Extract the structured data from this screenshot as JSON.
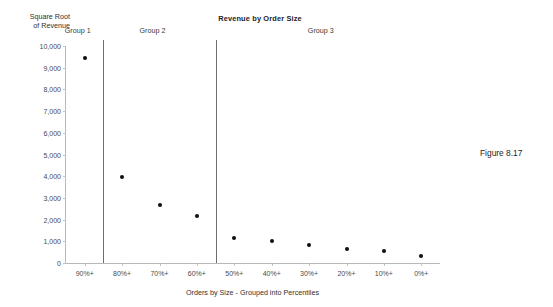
{
  "figure": {
    "caption": "Figure 8.17"
  },
  "chart_data": {
    "type": "scatter",
    "title": "Revenue by Order Size",
    "xlabel": "Orders by Size - Grouped into Percentiles",
    "ylabel": "Square Root\nof Revenue",
    "categories": [
      "90%+",
      "80%+",
      "70%+",
      "60%+",
      "50%+",
      "40%+",
      "30%+",
      "20%+",
      "10%+",
      "0%+"
    ],
    "values": [
      9450,
      3960,
      2680,
      2180,
      1150,
      1020,
      830,
      660,
      530,
      300
    ],
    "series": [
      {
        "name": "Square Root of Revenue",
        "values": [
          9450,
          3960,
          2680,
          2180,
          1150,
          1020,
          830,
          660,
          530,
          300
        ]
      }
    ],
    "ylim": [
      0,
      10000
    ],
    "ytick_labels": [
      "10,000",
      "9,000",
      "8,000",
      "7,000",
      "6,000",
      "5,000",
      "4,000",
      "3,000",
      "2,000",
      "1,000",
      "0"
    ],
    "ytick_values": [
      10000,
      9000,
      8000,
      7000,
      6000,
      5000,
      4000,
      3000,
      2000,
      1000,
      0
    ],
    "grid": false,
    "legend": false,
    "marker_color": "#0d0d0d",
    "axis_color": "#b9b9b9",
    "groups": [
      {
        "label": "Group 1",
        "categories": [
          "90%+"
        ]
      },
      {
        "label": "Group 2",
        "categories": [
          "80%+",
          "70%+",
          "60%+"
        ]
      },
      {
        "label": "Group 3",
        "categories": [
          "50%+",
          "40%+",
          "30%+",
          "20%+",
          "10%+",
          "0%+"
        ]
      }
    ],
    "group_divider_after": [
      0,
      3
    ]
  }
}
